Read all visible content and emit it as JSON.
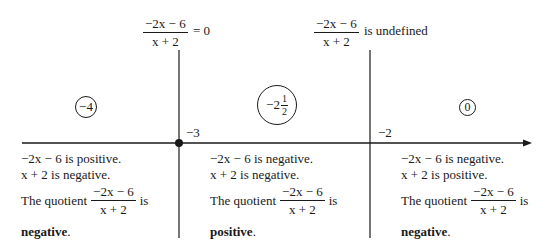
{
  "diagram": {
    "type": "sign-analysis-number-line",
    "expression": {
      "numerator": "−2x − 6",
      "denominator": "x + 2"
    },
    "top_labels": [
      {
        "numerator": "−2x − 6",
        "denominator": "x + 2",
        "suffix": "= 0"
      },
      {
        "numerator": "−2x − 6",
        "denominator": "x + 2",
        "suffix": "is undefined"
      }
    ],
    "critical_points": [
      {
        "label": "−3",
        "filled_dot": true
      },
      {
        "label": "−2",
        "filled_dot": false
      }
    ],
    "test_values": [
      {
        "whole": "−4"
      },
      {
        "whole": "−2",
        "frac_num": "1",
        "frac_den": "2"
      },
      {
        "whole": "0"
      }
    ],
    "regions": [
      {
        "line1": "−2x − 6 is positive.",
        "line2": "x + 2 is negative.",
        "quotient_prefix": "The quotient",
        "quotient_suffix": "is",
        "result": "negative",
        "result_punct": "."
      },
      {
        "line1": "−2x − 6 is negative.",
        "line2": "x + 2 is negative.",
        "quotient_prefix": "The quotient",
        "quotient_suffix": "is",
        "result": "positive",
        "result_punct": "."
      },
      {
        "line1": "−2x − 6 is negative.",
        "line2": "x + 2 is positive.",
        "quotient_prefix": "The quotient",
        "quotient_suffix": "is",
        "result": "negative",
        "result_punct": "."
      }
    ],
    "colors": {
      "ink": "#1a1a1a",
      "background": "#ffffff"
    }
  }
}
